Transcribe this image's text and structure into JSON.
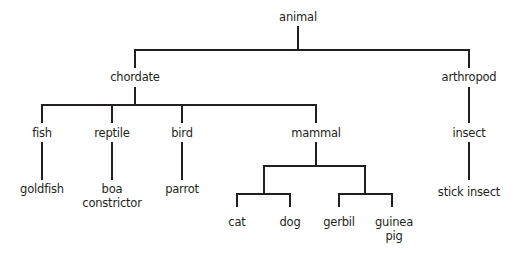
{
  "diagram": {
    "type": "taxonomy-tree",
    "line_color": "#231f20",
    "nodes": {
      "animal": "animal",
      "chordate": "chordate",
      "arthropod": "arthropod",
      "fish": "fish",
      "reptile": "reptile",
      "bird": "bird",
      "mammal": "mammal",
      "insect": "insect",
      "goldfish": "goldfish",
      "boa_line1": "boa",
      "boa_line2": "constrictor",
      "parrot": "parrot",
      "stick_insect": "stick insect",
      "cat": "cat",
      "dog": "dog",
      "gerbil": "gerbil",
      "guinea_line1": "guinea",
      "guinea_line2": "pig"
    },
    "edges": [
      [
        "animal",
        "chordate"
      ],
      [
        "animal",
        "arthropod"
      ],
      [
        "chordate",
        "fish"
      ],
      [
        "chordate",
        "reptile"
      ],
      [
        "chordate",
        "bird"
      ],
      [
        "chordate",
        "mammal"
      ],
      [
        "arthropod",
        "insect"
      ],
      [
        "fish",
        "goldfish"
      ],
      [
        "reptile",
        "boa constrictor"
      ],
      [
        "bird",
        "parrot"
      ],
      [
        "insect",
        "stick insect"
      ],
      [
        "mammal",
        "cat/dog group"
      ],
      [
        "mammal",
        "gerbil/guinea pig group"
      ],
      [
        "cat/dog group",
        "cat"
      ],
      [
        "cat/dog group",
        "dog"
      ],
      [
        "gerbil/guinea pig group",
        "gerbil"
      ],
      [
        "gerbil/guinea pig group",
        "guinea pig"
      ]
    ]
  }
}
